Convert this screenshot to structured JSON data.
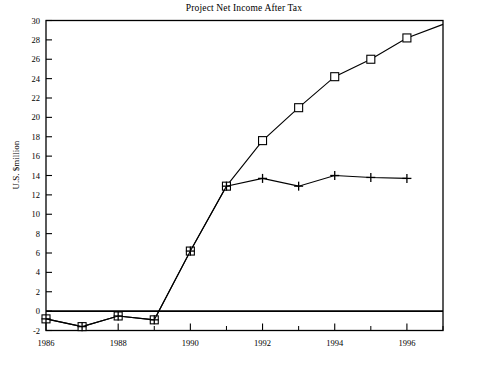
{
  "chart_data": {
    "type": "line",
    "title": "Project Net Income After Tax",
    "xlabel": "",
    "ylabel": "U.S. $million",
    "x": [
      1986,
      1987,
      1988,
      1989,
      1990,
      1991,
      1992,
      1993,
      1994,
      1995,
      1996,
      1997
    ],
    "xlim": [
      1986,
      1997
    ],
    "ylim": [
      -2,
      30
    ],
    "ytick_labels": [
      "30",
      "28",
      "26",
      "24",
      "22",
      "20",
      "18",
      "16",
      "14",
      "12",
      "10",
      "8",
      "6",
      "4",
      "2",
      "0",
      "-2"
    ],
    "ytick_values": [
      30,
      28,
      26,
      24,
      22,
      20,
      18,
      16,
      14,
      12,
      10,
      8,
      6,
      4,
      2,
      0,
      -2
    ],
    "xtick_labels": [
      "1986",
      "1988",
      "1990",
      "1992",
      "1994",
      "1996"
    ],
    "xtick_values": [
      1986,
      1988,
      1990,
      1992,
      1994,
      1996
    ],
    "xminor_tick_values": [
      1987,
      1989,
      1991,
      1993,
      1995,
      1997
    ],
    "grid": false,
    "legend": false,
    "zero_line": true,
    "series": [
      {
        "name": "series-square",
        "marker": "open-square",
        "x": [
          1986,
          1987,
          1988,
          1989,
          1990,
          1991,
          1992,
          1993,
          1994,
          1995,
          1996,
          1997
        ],
        "values": [
          -0.8,
          -1.6,
          -0.5,
          -0.9,
          6.2,
          12.9,
          17.6,
          21.0,
          24.2,
          26.0,
          28.2,
          29.6
        ],
        "marker_shown_at": [
          1986,
          1987,
          1988,
          1989,
          1990,
          1991,
          1992,
          1993,
          1994,
          1995,
          1996
        ],
        "color": "#000000"
      },
      {
        "name": "series-plus",
        "marker": "plus",
        "x": [
          1986,
          1987,
          1988,
          1989,
          1990,
          1991,
          1992,
          1993,
          1994,
          1995,
          1996
        ],
        "values": [
          -0.8,
          -1.6,
          -0.5,
          -0.9,
          6.2,
          12.9,
          13.7,
          12.9,
          14.0,
          13.8,
          13.7
        ],
        "marker_shown_at": [
          1986,
          1987,
          1988,
          1989,
          1990,
          1991,
          1992,
          1993,
          1994,
          1995,
          1996
        ],
        "color": "#000000"
      }
    ]
  },
  "axes": {
    "title": "Project Net Income After Tax",
    "y_axis_title": "U.S. $million"
  }
}
